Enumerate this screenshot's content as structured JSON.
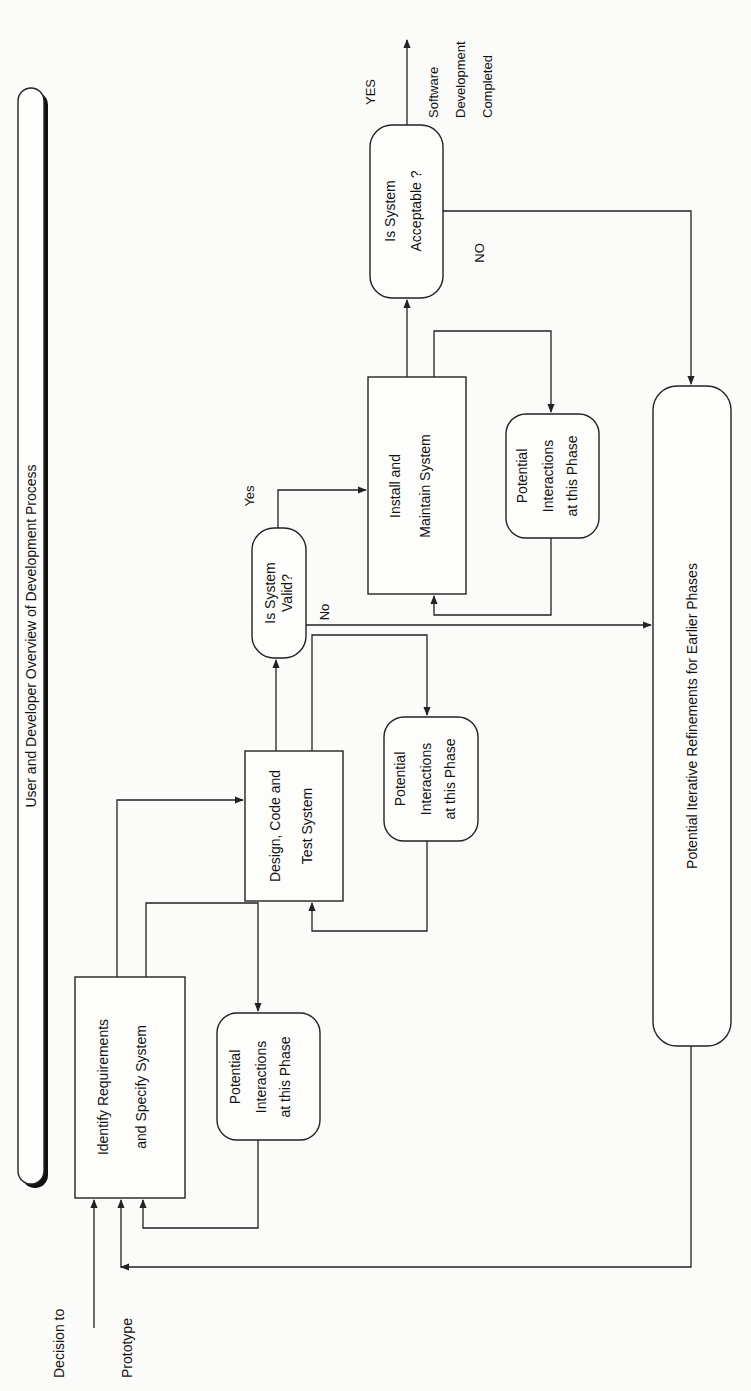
{
  "title": "User and Developer Overview of Development Process",
  "entry": {
    "line1": "Decision to",
    "line2": "Prototype"
  },
  "nodes": {
    "identify": {
      "line1": "Identify Requirements",
      "line2": "and Specify System"
    },
    "design": {
      "line1": "Design, Code and",
      "line2": "Test System"
    },
    "valid": {
      "line1": "Is System",
      "line2": "Valid?"
    },
    "install": {
      "line1": "Install and",
      "line2": "Maintain System"
    },
    "acceptable": {
      "line1": "Is System",
      "line2": "Acceptable ?"
    },
    "refinements": {
      "label": "Potential Iterative Refinements for Earlier Phases"
    },
    "interactions": [
      {
        "line1": "Potential",
        "line2": "Interactions",
        "line3": "at this Phase"
      },
      {
        "line1": "Potential",
        "line2": "Interactions",
        "line3": "at this Phase"
      },
      {
        "line1": "Potential",
        "line2": "Interactions",
        "line3": "at this Phase"
      }
    ]
  },
  "edge_labels": {
    "valid_yes": "Yes",
    "valid_no": "No",
    "accept_yes": "YES",
    "accept_no": "NO"
  },
  "outcome": {
    "line1": "Software",
    "line2": "Development",
    "line3": "Completed"
  },
  "colors": {
    "stroke": "#222222",
    "background": "#fbfbf9"
  }
}
